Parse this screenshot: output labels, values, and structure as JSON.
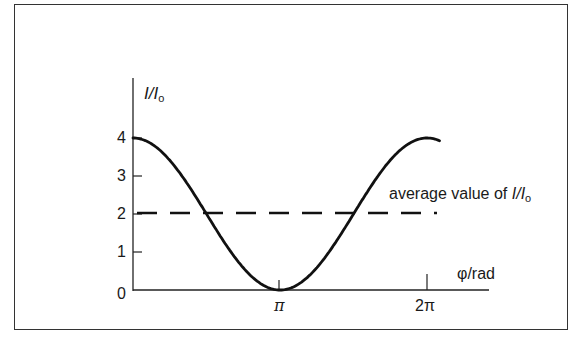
{
  "chart_data": {
    "type": "line",
    "title": "",
    "xlabel": "φ/rad",
    "ylabel": "I/Io",
    "x_ticks": [
      {
        "value": 0,
        "label": ""
      },
      {
        "value": 3.14159,
        "label": "π"
      },
      {
        "value": 6.28318,
        "label": "2π"
      }
    ],
    "y_ticks": [
      0,
      1,
      2,
      3,
      4
    ],
    "xlim": [
      0,
      6.5
    ],
    "ylim": [
      0,
      5.4
    ],
    "grid": false,
    "legend": null,
    "series": [
      {
        "name": "I/Io",
        "style": "solid",
        "function": "2*(1+cos(phi))",
        "x": [
          0,
          0.785,
          1.571,
          2.356,
          3.142,
          3.927,
          4.712,
          5.498,
          6.283,
          6.5
        ],
        "values": [
          4.0,
          3.41,
          2.0,
          0.59,
          0.0,
          0.59,
          2.0,
          3.41,
          4.0,
          3.95
        ]
      },
      {
        "name": "average value of I/Io",
        "style": "dashed",
        "x": [
          0,
          6.4
        ],
        "values": [
          2,
          2
        ]
      }
    ],
    "annotations": [
      {
        "text": "average value of I/Io",
        "x": 5.2,
        "y": 2.5
      }
    ]
  },
  "labels": {
    "y_axis_main": "I/I",
    "y_axis_sub": "o",
    "x_axis": "φ/rad",
    "y_ticks": [
      "0",
      "1",
      "2",
      "3",
      "4"
    ],
    "x_tick_pi": "π",
    "x_tick_2pi": "2π",
    "annotation_prefix": "average value of ",
    "annotation_var": "I/I",
    "annotation_sub": "o"
  },
  "colors": {
    "line": "#111111",
    "frame": "#333333",
    "background": "#ffffff"
  }
}
